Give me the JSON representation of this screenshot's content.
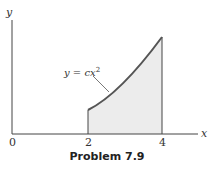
{
  "figure": {
    "caption": "Problem 7.9",
    "x_axis_label": "x",
    "y_axis_label": "y",
    "ticks": [
      "0",
      "2",
      "4"
    ],
    "curve_label": "y = cx²",
    "curve_label_main": "y = cx",
    "curve_label_sup": "2",
    "shaded_region": "area under y = cx² from x = 2 to x = 4",
    "colors": {
      "curve": "#555555",
      "fill": "#ececec",
      "axis": "#444444"
    }
  }
}
